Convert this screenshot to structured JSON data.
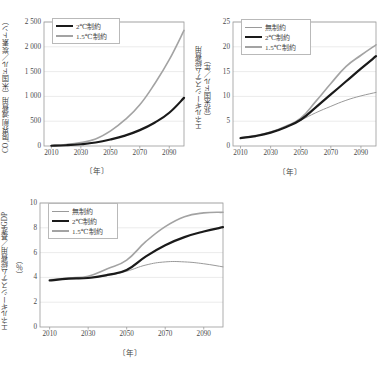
{
  "figure": {
    "background": "#ffffff",
    "panel_count": 3,
    "axis_color": "#9a9a9a",
    "grid_color": "#e2e2e2",
    "text_color": "#3f3f3f"
  },
  "series_styles": {
    "unconstrained": {
      "name": "無制約",
      "color": "#9a9a9a",
      "width": 1.0
    },
    "two_deg": {
      "name": "2℃制約",
      "color": "#1a1a1a",
      "width": 2.2
    },
    "one_five_deg": {
      "name": "1.5℃制約",
      "color": "#a3a3a3",
      "width": 1.6
    }
  },
  "chart_data": [
    {
      "id": "panel-a",
      "type": "line",
      "title": "",
      "ylabel": "CO₂限界削減費用（米国ドル／炭素トン）",
      "xlabel": "〔年〕",
      "xlim": [
        2005,
        2100
      ],
      "ylim": [
        0,
        2500
      ],
      "xticks": [
        2010,
        2030,
        2050,
        2070,
        2090
      ],
      "xticklabels": [
        "2010",
        "2030",
        "2050",
        "2070",
        "2090"
      ],
      "yticks": [
        0,
        500,
        1000,
        1500,
        2000,
        2500
      ],
      "yticklabels": [
        "0",
        "500",
        "1 000",
        "1 500",
        "2 000",
        "2 500"
      ],
      "grid": "horizontal",
      "legend_position": "upper-left",
      "legend_entries": [
        "2℃制約",
        "1.5℃制約"
      ],
      "x": [
        2010,
        2020,
        2030,
        2040,
        2050,
        2060,
        2070,
        2080,
        2090,
        2100
      ],
      "series": [
        {
          "name": "2℃制約",
          "key": "two_deg",
          "color": "#1a1a1a",
          "values": [
            5,
            15,
            35,
            70,
            130,
            210,
            320,
            470,
            670,
            970
          ]
        },
        {
          "name": "1.5℃制約",
          "key": "one_five_deg",
          "color": "#a3a3a3",
          "values": [
            10,
            30,
            70,
            140,
            300,
            530,
            830,
            1250,
            1740,
            2330
          ]
        }
      ]
    },
    {
      "id": "panel-b",
      "type": "line",
      "title": "",
      "ylabel_line1": "エネルギーシステム総費用",
      "ylabel_line2": "（兆米国ドル／年）",
      "xlabel": "〔年〕",
      "xlim": [
        2005,
        2100
      ],
      "ylim": [
        0,
        25
      ],
      "xticks": [
        2010,
        2030,
        2050,
        2070,
        2090
      ],
      "xticklabels": [
        "2010",
        "2030",
        "2050",
        "2070",
        "2090"
      ],
      "yticks": [
        0,
        5,
        10,
        15,
        20,
        25
      ],
      "yticklabels": [
        "0",
        "5",
        "10",
        "15",
        "20",
        "25"
      ],
      "grid": "horizontal",
      "legend_position": "upper-left",
      "legend_entries": [
        "無制約",
        "2℃制約",
        "1.5℃制約"
      ],
      "x": [
        2010,
        2020,
        2030,
        2040,
        2050,
        2060,
        2070,
        2080,
        2090,
        2100
      ],
      "series": [
        {
          "name": "無制約",
          "key": "unconstrained",
          "color": "#9a9a9a",
          "values": [
            1.6,
            2.0,
            2.7,
            3.8,
            5.2,
            6.7,
            8.0,
            9.2,
            10.1,
            10.8
          ]
        },
        {
          "name": "2℃制約",
          "key": "two_deg",
          "color": "#1a1a1a",
          "values": [
            1.6,
            2.0,
            2.7,
            3.8,
            5.3,
            7.8,
            10.4,
            13.0,
            15.6,
            18.1
          ]
        },
        {
          "name": "1.5℃制約",
          "key": "one_five_deg",
          "color": "#a3a3a3",
          "values": [
            1.6,
            2.1,
            2.8,
            4.0,
            5.6,
            9.0,
            12.6,
            16.0,
            18.3,
            20.4
          ]
        }
      ]
    },
    {
      "id": "panel-c",
      "type": "line",
      "title": "",
      "ylabel": "エネルギーシステム総費用／基準GDP",
      "ylabel_unit": "（％）",
      "xlabel": "〔年〕",
      "xlim": [
        2005,
        2100
      ],
      "ylim": [
        0,
        10
      ],
      "xticks": [
        2010,
        2030,
        2050,
        2070,
        2090
      ],
      "xticklabels": [
        "2010",
        "2030",
        "2050",
        "2070",
        "2090"
      ],
      "yticks": [
        0,
        2,
        4,
        6,
        8,
        10
      ],
      "yticklabels": [
        "0",
        "2",
        "4",
        "6",
        "8",
        "10"
      ],
      "grid": "horizontal",
      "legend_position": "upper-left",
      "legend_entries": [
        "無制約",
        "2℃制約",
        "1.5℃制約"
      ],
      "x": [
        2010,
        2020,
        2030,
        2040,
        2050,
        2060,
        2070,
        2080,
        2090,
        2100
      ],
      "series": [
        {
          "name": "無制約",
          "key": "unconstrained",
          "color": "#9a9a9a",
          "values": [
            3.75,
            3.9,
            3.95,
            4.15,
            4.5,
            5.0,
            5.25,
            5.25,
            5.1,
            4.85
          ]
        },
        {
          "name": "2℃制約",
          "key": "two_deg",
          "color": "#1a1a1a",
          "values": [
            3.75,
            3.9,
            3.95,
            4.2,
            4.6,
            5.7,
            6.6,
            7.25,
            7.7,
            8.05
          ]
        },
        {
          "name": "1.5℃制約",
          "key": "one_five_deg",
          "color": "#a3a3a3",
          "values": [
            3.8,
            3.95,
            4.1,
            4.7,
            5.4,
            6.9,
            8.1,
            8.9,
            9.2,
            9.25
          ]
        }
      ]
    }
  ]
}
